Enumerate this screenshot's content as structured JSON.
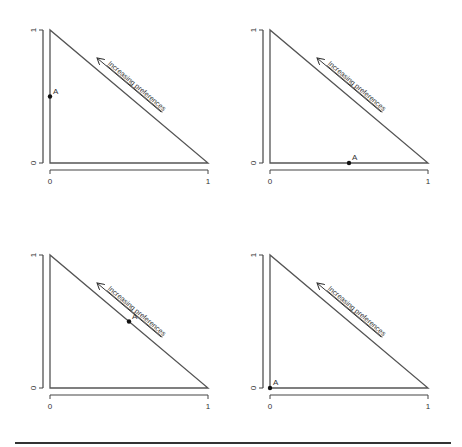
{
  "figure": {
    "arrow_label": "Increasing preferences",
    "point_label": "A",
    "x_ticks": [
      "0",
      "1"
    ],
    "y_ticks": [
      "0",
      "1"
    ],
    "colors": {
      "axis": "#444444",
      "triangle": "#555555",
      "point": "#111111",
      "text": "#333333"
    }
  },
  "chart_data": [
    {
      "type": "scatter",
      "title": "",
      "xlabel": "",
      "ylabel": "",
      "xlim": [
        0,
        1
      ],
      "ylim": [
        0,
        1
      ],
      "x_ticks": [
        0,
        1
      ],
      "y_ticks": [
        0,
        1
      ],
      "grid": false,
      "shapes": [
        {
          "type": "triangle",
          "vertices": [
            [
              0,
              0
            ],
            [
              0,
              1
            ],
            [
              1,
              0
            ]
          ]
        }
      ],
      "annotations": [
        {
          "text": "Increasing preferences",
          "arrow": "toward (0,1) along hypotenuse"
        }
      ],
      "points": [
        {
          "label": "A",
          "x": 0,
          "y": 0.5
        }
      ]
    },
    {
      "type": "scatter",
      "title": "",
      "xlabel": "",
      "ylabel": "",
      "xlim": [
        0,
        1
      ],
      "ylim": [
        0,
        1
      ],
      "x_ticks": [
        0,
        1
      ],
      "y_ticks": [
        0,
        1
      ],
      "grid": false,
      "shapes": [
        {
          "type": "triangle",
          "vertices": [
            [
              0,
              0
            ],
            [
              0,
              1
            ],
            [
              1,
              0
            ]
          ]
        }
      ],
      "annotations": [
        {
          "text": "Increasing preferences",
          "arrow": "toward (0,1) along hypotenuse"
        }
      ],
      "points": [
        {
          "label": "A",
          "x": 0.5,
          "y": 0
        }
      ]
    },
    {
      "type": "scatter",
      "title": "",
      "xlabel": "",
      "ylabel": "",
      "xlim": [
        0,
        1
      ],
      "ylim": [
        0,
        1
      ],
      "x_ticks": [
        0,
        1
      ],
      "y_ticks": [
        0,
        1
      ],
      "grid": false,
      "shapes": [
        {
          "type": "triangle",
          "vertices": [
            [
              0,
              0
            ],
            [
              0,
              1
            ],
            [
              1,
              0
            ]
          ]
        }
      ],
      "annotations": [
        {
          "text": "Increasing preferences",
          "arrow": "toward (0,1) along hypotenuse"
        }
      ],
      "points": [
        {
          "label": "A",
          "x": 0.5,
          "y": 0.5
        }
      ]
    },
    {
      "type": "scatter",
      "title": "",
      "xlabel": "",
      "ylabel": "",
      "xlim": [
        0,
        1
      ],
      "ylim": [
        0,
        1
      ],
      "x_ticks": [
        0,
        1
      ],
      "y_ticks": [
        0,
        1
      ],
      "grid": false,
      "shapes": [
        {
          "type": "triangle",
          "vertices": [
            [
              0,
              0
            ],
            [
              0,
              1
            ],
            [
              1,
              0
            ]
          ]
        }
      ],
      "annotations": [
        {
          "text": "Increasing preferences",
          "arrow": "toward (0,1) along hypotenuse"
        }
      ],
      "points": [
        {
          "label": "A",
          "x": 0,
          "y": 0
        }
      ]
    }
  ]
}
